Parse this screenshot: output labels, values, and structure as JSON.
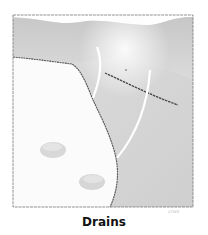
{
  "figure": {
    "caption": "Drains",
    "signature": "c/ws",
    "illustration": {
      "subject": "surgical drains illustration",
      "style": "pencil shading"
    },
    "colors": {
      "background": "#ffffff",
      "shade_dark": "#b8b8b8",
      "shade_mid": "#d4d4d4",
      "shade_light": "#e8e8e8",
      "line": "#555555",
      "drain_tube": "#ffffff",
      "caption": "#111111"
    }
  }
}
